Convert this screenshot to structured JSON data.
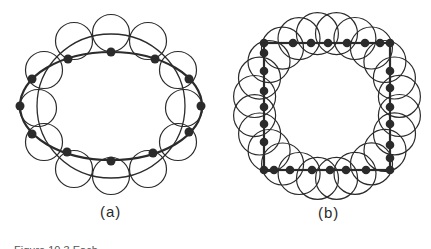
{
  "figure": {
    "panels": [
      {
        "id": "a",
        "label": "(a)",
        "shape": "ellipse",
        "node_count": 12,
        "covering_circle_count": 12
      },
      {
        "id": "b",
        "label": "(b)",
        "shape": "square",
        "node_count": 28,
        "covering_circle_count": 24
      }
    ],
    "caption": "Figure 10.3  Each"
  },
  "colors": {
    "stroke": "#2b2b2b",
    "node": "#2b2b2b",
    "background": "#ffffff"
  }
}
